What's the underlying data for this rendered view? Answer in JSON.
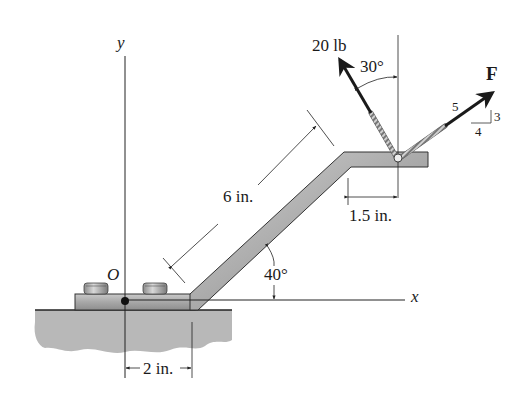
{
  "figure": {
    "type": "statics free-body diagram",
    "axes": {
      "x_label": "x",
      "y_label": "y",
      "origin_label": "O"
    },
    "forces": [
      {
        "label": "20 lb",
        "angle_label": "30°",
        "angle_reference": "from vertical"
      },
      {
        "label": "F",
        "slope": {
          "hyp": "5",
          "rise": "3",
          "run": "4"
        }
      }
    ],
    "dimensions": {
      "incline_length": "6 in.",
      "top_offset": "1.5 in.",
      "base_offset": "2 in.",
      "incline_angle": "40°"
    },
    "colors": {
      "member_fill": "#a9a9a9",
      "ground_fill": "#b5b5b5",
      "arrow": "#1a1a1a",
      "line": "#222222"
    }
  }
}
